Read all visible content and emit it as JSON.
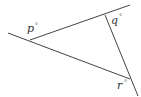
{
  "diagram": {
    "type": "triangle-with-extended-sides",
    "line_color": "#444444",
    "labels": {
      "p": "p",
      "q": "q",
      "r": "r",
      "degree": "°"
    },
    "angles": [
      {
        "vertex": "left",
        "label": "p°"
      },
      {
        "vertex": "top-right",
        "label": "q°"
      },
      {
        "vertex": "bottom-right",
        "label": "r°"
      }
    ]
  }
}
